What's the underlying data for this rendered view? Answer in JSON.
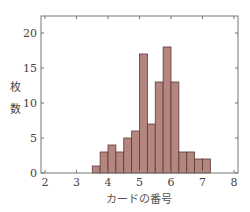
{
  "chart_data": {
    "type": "bar",
    "subtype": "histogram",
    "title": "",
    "xlabel": "カードの番号",
    "ylabel": "枚数",
    "bin_width": 0.25,
    "bins_start": [
      3.5,
      3.75,
      4.0,
      4.25,
      4.5,
      4.75,
      5.0,
      5.25,
      5.5,
      5.75,
      6.0,
      6.25,
      6.5,
      6.75,
      7.0
    ],
    "values": [
      1,
      3,
      4,
      3,
      5,
      6,
      17,
      7,
      13,
      18,
      13,
      3,
      3,
      2,
      2
    ],
    "xlim": [
      2,
      8
    ],
    "ylim": [
      0,
      22
    ],
    "xticks": [
      2,
      3,
      4,
      5,
      6,
      7,
      8
    ],
    "yticks": [
      0,
      5,
      10,
      15,
      20
    ],
    "grid": false,
    "legend": null,
    "bar_color": "#b58580",
    "edge_color": "#5a3a36"
  },
  "labels": {
    "ylabel_char1": "枚",
    "ylabel_char2": "数",
    "xlabel": "カードの番号"
  }
}
